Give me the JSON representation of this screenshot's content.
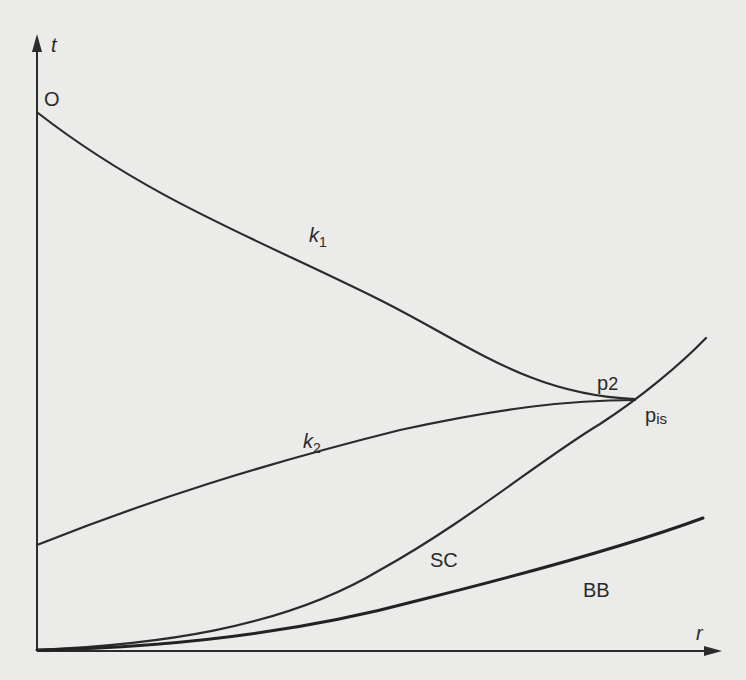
{
  "diagram": {
    "axes": {
      "y_label": "t",
      "x_label": "r"
    },
    "points": {
      "origin_label": "O",
      "p2_label": "p",
      "p2_sub": "2",
      "pis_label": "p",
      "pis_sub": "is"
    },
    "curves": {
      "k1_label": "k",
      "k1_sub": "1",
      "k2_label": "k",
      "k2_sub": "2",
      "sc_label": "SC",
      "bb_label": "BB"
    }
  }
}
